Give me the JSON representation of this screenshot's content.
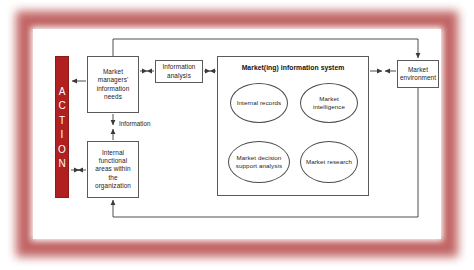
{
  "diagram": {
    "title": "Market(ing) information system",
    "action_bar": {
      "name": "ACTION",
      "letters": [
        "A",
        "C",
        "T",
        "I",
        "O",
        "N"
      ],
      "color": "#b02020",
      "text_color": "#ffffff"
    },
    "nodes": {
      "manager_needs": "Market managers' information needs",
      "internal_areas": "Internal functional areas within the organization",
      "info_analysis": "Information analysis",
      "mis_title": "Market(ing) information system",
      "market_environment": "Market environment"
    },
    "ellipses": {
      "internal_records": "Internal records",
      "market_intelligence": "Market intelligence",
      "mdss": "Market decision support analysis",
      "market_research": "Market research"
    },
    "edge_labels": {
      "information": "Information"
    },
    "connections": [
      {
        "from": "ACTION",
        "to": "Market managers' information needs",
        "style": "single-arrow-left"
      },
      {
        "from": "ACTION",
        "to": "Internal functional areas within the organization",
        "style": "double-arrow"
      },
      {
        "from": "Market managers' information needs",
        "to": "Internal functional areas within the organization",
        "style": "double-arrow",
        "label": "Information"
      },
      {
        "from": "Market managers' information needs",
        "to": "Information analysis",
        "style": "double-arrow"
      },
      {
        "from": "Information analysis",
        "to": "Market(ing) information system",
        "style": "double-arrow"
      },
      {
        "from": "Market(ing) information system",
        "to": "Market environment",
        "style": "double-arrow"
      },
      {
        "from": "Market managers' information needs",
        "to": "Market environment",
        "style": "top-loop-arrow-right"
      },
      {
        "from": "Market environment",
        "to": "Internal functional areas within the organization",
        "style": "bottom-loop-arrow-left"
      },
      {
        "from": "Internal records",
        "to": "Market intelligence",
        "style": "double-arrow"
      },
      {
        "from": "Internal records",
        "to": "Market decision support analysis",
        "style": "double-arrow"
      },
      {
        "from": "Market intelligence",
        "to": "Market research",
        "style": "double-arrow"
      },
      {
        "from": "Market decision support analysis",
        "to": "Market research",
        "style": "double-arrow"
      },
      {
        "from": "Internal records",
        "to": "Market research",
        "style": "diagonal-double-arrow"
      },
      {
        "from": "Market intelligence",
        "to": "Market decision support analysis",
        "style": "diagonal-double-arrow"
      }
    ],
    "colors": {
      "frame": "#bf5d5d",
      "action_red": "#b02020",
      "line": "#4d4d4d",
      "background": "#ffffff"
    }
  }
}
